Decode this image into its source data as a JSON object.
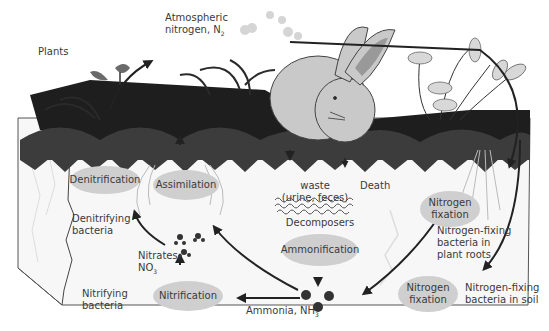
{
  "diagram": {
    "labels": {
      "plants": "Plants",
      "atmospheric_line1": "Atmospheric",
      "atmospheric_line2": "nitrogen, N",
      "atmospheric_sub": "2",
      "waste_line1": "waste",
      "waste_line2": "(urine, feces)",
      "death": "Death",
      "decomposers": "Decomposers",
      "denitrifying_line1": "Denitrifying",
      "denitrifying_line2": "bacteria",
      "nitrates_line1": "Nitrates,",
      "nitrates_line2": "NO",
      "nitrates_sub": "3",
      "nitrifying_line1": "Nitrifying",
      "nitrifying_line2": "bacteria",
      "ammonia": "Ammonia, NH",
      "ammonia_sub": "3",
      "fixing_roots_line1": "Nitrogen-fixing",
      "fixing_roots_line2": "bacteria in",
      "fixing_roots_line3": "plant roots",
      "fixing_soil_line1": "Nitrogen-fixing",
      "fixing_soil_line2": "bacteria in soil"
    },
    "processes": {
      "denitrification": "Denitrification",
      "assimilation": "Assimilation",
      "ammonification": "Ammonification",
      "nitrification": "Nitrification",
      "fixation_upper_line1": "Nitrogen",
      "fixation_upper_line2": "fixation",
      "fixation_lower_line1": "Nitrogen",
      "fixation_lower_line2": "fixation"
    },
    "colors": {
      "oval_fill": "#cfcfcf",
      "soil_fill": "#f7f7f7",
      "log": "#1e1e1e",
      "rabbit": "#c9c9c9",
      "arrow": "#222222",
      "foliage": "#3c3c3c"
    }
  }
}
